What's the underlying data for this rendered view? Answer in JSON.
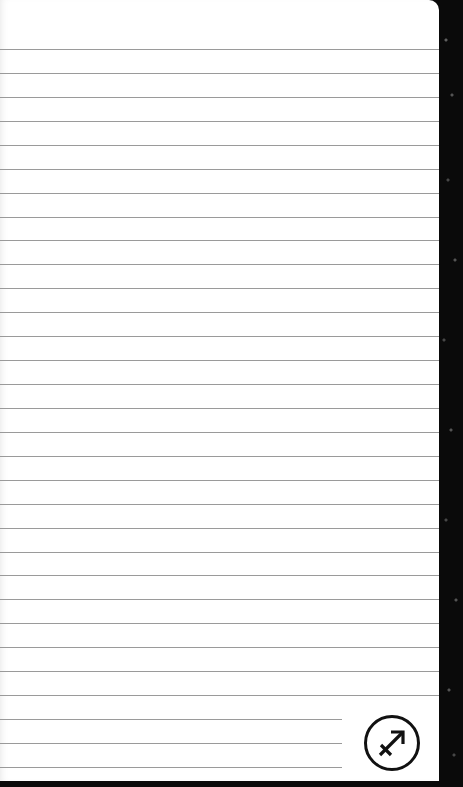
{
  "page": {
    "background_color": "#0a0a0a",
    "paper_color": "#ffffff",
    "rule_color": "#9a9a9a"
  },
  "ruled_lines": {
    "first_y": 49,
    "spacing": 23.93,
    "full_width_count": 28,
    "short_count": 3,
    "full_width": 439,
    "short_width": 342
  },
  "zodiac_icon": {
    "name": "sagittarius",
    "symbol": "♐"
  }
}
